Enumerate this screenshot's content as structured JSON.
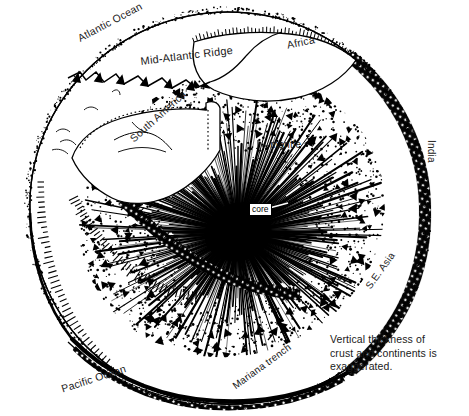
{
  "figure": {
    "background_color": "#ffffff",
    "ink_color": "#000000",
    "width": 469,
    "height": 416
  },
  "labels": {
    "atlantic_ocean": "Atlantic Ocean",
    "mid_atlantic_ridge": "Mid-Atlantic Ridge",
    "africa": "Africa",
    "south_america": "South America",
    "india": "India",
    "se_asia": "S.E. Asia",
    "pacific_ocean": "Pacific Ocean",
    "mariana_trench": "Mariana trench",
    "mantle": "mantle",
    "core": "core"
  },
  "caption": {
    "line1": "Vertical thickness of",
    "line2": "crust and continents is",
    "line3": "exaggerated."
  }
}
